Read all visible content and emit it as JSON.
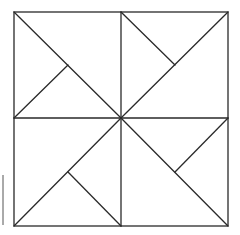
{
  "figure": {
    "stroke_color": "#2a2a2a",
    "background": "#ffffff",
    "outer_square": {
      "left": 14,
      "top": 12,
      "right": 228,
      "bottom": 226
    },
    "center": [
      121,
      118
    ],
    "lines": [
      {
        "name": "top-left-diagonal",
        "x1": 14,
        "y1": 12,
        "x2": 121,
        "y2": 118
      },
      {
        "name": "top-left-branch",
        "x1": 14,
        "y1": 118,
        "x2": 68,
        "y2": 65
      },
      {
        "name": "top-right-diagonal",
        "x1": 228,
        "y1": 12,
        "x2": 121,
        "y2": 118
      },
      {
        "name": "top-right-branch",
        "x1": 121,
        "y1": 12,
        "x2": 175,
        "y2": 65
      },
      {
        "name": "bottom-left-diagonal",
        "x1": 14,
        "y1": 226,
        "x2": 121,
        "y2": 118
      },
      {
        "name": "bottom-left-branch",
        "x1": 121,
        "y1": 226,
        "x2": 68,
        "y2": 172
      },
      {
        "name": "bottom-right-diagonal",
        "x1": 228,
        "y1": 226,
        "x2": 121,
        "y2": 118
      },
      {
        "name": "bottom-right-branch",
        "x1": 228,
        "y1": 118,
        "x2": 175,
        "y2": 172
      }
    ]
  }
}
